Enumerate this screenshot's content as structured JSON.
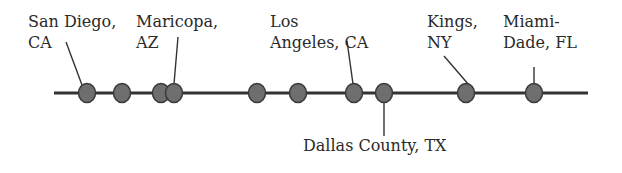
{
  "diagram": {
    "type": "timeline",
    "colors": {
      "line": "#333333",
      "node_fill": "#6e6e6e",
      "node_stroke": "#3a3a3a",
      "text": "#2a2a2a"
    },
    "axis": {
      "x1": 54,
      "x2": 588,
      "y": 93
    },
    "nodes": [
      {
        "x": 87
      },
      {
        "x": 122
      },
      {
        "x": 161
      },
      {
        "x": 174
      },
      {
        "x": 257
      },
      {
        "x": 298
      },
      {
        "x": 354
      },
      {
        "x": 384
      },
      {
        "x": 466
      },
      {
        "x": 534
      }
    ],
    "labels": [
      {
        "id": "san-diego",
        "line1": "San Diego,",
        "line2": "CA"
      },
      {
        "id": "maricopa",
        "line1": "Maricopa,",
        "line2": "AZ"
      },
      {
        "id": "los-angeles",
        "line1": "Los",
        "line2": "Angeles, CA"
      },
      {
        "id": "kings",
        "line1": "Kings,",
        "line2": "NY"
      },
      {
        "id": "miami-dade",
        "line1": "Miami-",
        "line2": "Dade, FL"
      },
      {
        "id": "dallas",
        "line1": "Dallas County, TX"
      }
    ]
  }
}
